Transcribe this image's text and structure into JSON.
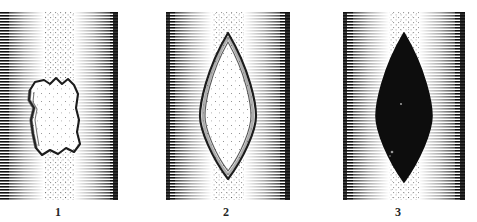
{
  "figure": {
    "medium": "line-engraving with horizontal hatching and stipple",
    "background_color": "#ffffff",
    "ink_color": "#1a1a1a",
    "panel_count": 3
  },
  "panels": [
    {
      "number": "1",
      "caption": "1",
      "shape_name": "irregular-torn-wound",
      "shape_description": "irregular jagged torn outline, unfilled pale interior",
      "fill": "none",
      "outline_color": "#1c1c1c",
      "interior_tone": "stipple-light",
      "edge_hatching": "dense-horizontal-both-sides",
      "shape_points": "30,78 35,70 44,68 50,72 56,66 62,72 68,67 74,73 78,82 76,96 79,108 77,120 80,132 74,140 66,136 58,142 50,138 42,143 36,136 33,122 31,108 34,96 29,88",
      "bbox": {
        "x": 28,
        "y": 66,
        "w": 52,
        "h": 79
      }
    },
    {
      "number": "2",
      "caption": "2",
      "shape_name": "lens-wound-outline",
      "shape_description": "pointed oval (vesica / lens) with double outline, stippled pale interior",
      "fill": "none",
      "outline_color": "#1c1c1c",
      "interior_tone": "stipple-light",
      "edge_hatching": "dense-horizontal-both-sides",
      "bbox": {
        "x": 198,
        "y": 33,
        "w": 62,
        "h": 142
      }
    },
    {
      "number": "3",
      "caption": "3",
      "shape_name": "lens-wound-solid",
      "shape_description": "pointed oval (vesica / lens) filled solid black",
      "fill": "solid-black",
      "outline_color": "#0d0d0d",
      "interior_tone": "solid",
      "edge_hatching": "dense-horizontal-both-sides",
      "bbox": {
        "x": 378,
        "y": 33,
        "w": 62,
        "h": 145
      }
    }
  ],
  "captions": {
    "one": "1",
    "two": "2",
    "three": "3"
  }
}
